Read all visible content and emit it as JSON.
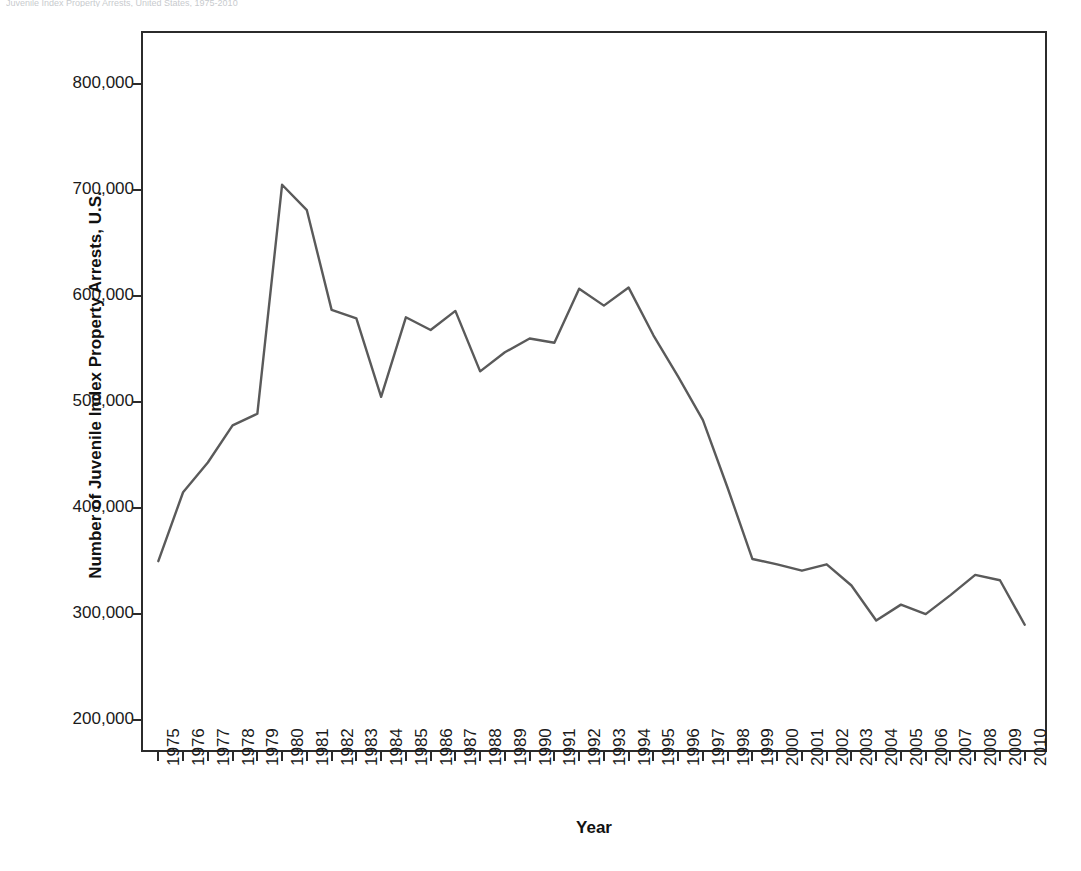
{
  "caption": {
    "text": "Juvenile Index Property Arrests, United States, 1975-2010"
  },
  "chart_data": {
    "type": "line",
    "title": "",
    "xlabel": "Year",
    "ylabel": "Number of Juvenile Index Property Arrests, U.S.",
    "x": [
      1975,
      1976,
      1977,
      1978,
      1979,
      1980,
      1981,
      1982,
      1983,
      1984,
      1985,
      1986,
      1987,
      1988,
      1989,
      1990,
      1991,
      1992,
      1993,
      1994,
      1995,
      1996,
      1997,
      1998,
      1999,
      2000,
      2001,
      2002,
      2003,
      2004,
      2005,
      2006,
      2007,
      2008,
      2009,
      2010
    ],
    "values": [
      350000,
      415000,
      443000,
      478000,
      489000,
      705000,
      681000,
      587000,
      579000,
      505000,
      580000,
      568000,
      586000,
      529000,
      547000,
      560000,
      556000,
      607000,
      591000,
      608000,
      563000,
      524000,
      483000,
      419000,
      352000,
      347000,
      341000,
      347000,
      327000,
      294000,
      309000,
      300000,
      318000,
      337000,
      332000,
      290000
    ],
    "categories": [
      "1975",
      "1976",
      "1977",
      "1978",
      "1979",
      "1980",
      "1981",
      "1982",
      "1983",
      "1984",
      "1985",
      "1986",
      "1987",
      "1988",
      "1989",
      "1990",
      "1991",
      "1992",
      "1993",
      "1994",
      "1995",
      "1996",
      "1997",
      "1998",
      "1999",
      "2000",
      "2001",
      "2002",
      "2003",
      "2004",
      "2005",
      "2006",
      "2007",
      "2008",
      "2009",
      "2010"
    ],
    "ylim": [
      170000,
      850000
    ],
    "xlim": [
      1974.3,
      2010.9
    ],
    "y_ticks": [
      200000,
      300000,
      400000,
      500000,
      600000,
      700000,
      800000
    ],
    "y_tick_labels": [
      "200,000",
      "300,000",
      "400,000",
      "500,000",
      "600,000",
      "700,000",
      "800,000"
    ],
    "grid": false,
    "legend": false,
    "legend_position": "none",
    "series": [
      {
        "name": "Juvenile Index Property Arrests",
        "color": "#5a5a5a",
        "line_width": 2.4,
        "values": [
          350000,
          415000,
          443000,
          478000,
          489000,
          705000,
          681000,
          587000,
          579000,
          505000,
          580000,
          568000,
          586000,
          529000,
          547000,
          560000,
          556000,
          607000,
          591000,
          608000,
          563000,
          524000,
          483000,
          419000,
          352000,
          347000,
          341000,
          347000,
          327000,
          294000,
          309000,
          300000,
          318000,
          337000,
          332000,
          290000
        ]
      }
    ]
  },
  "style": {
    "frame_color": "#2b2b2b",
    "line_color": "#5a5a5a",
    "text_color": "#1a1a1a",
    "background": "#ffffff"
  }
}
